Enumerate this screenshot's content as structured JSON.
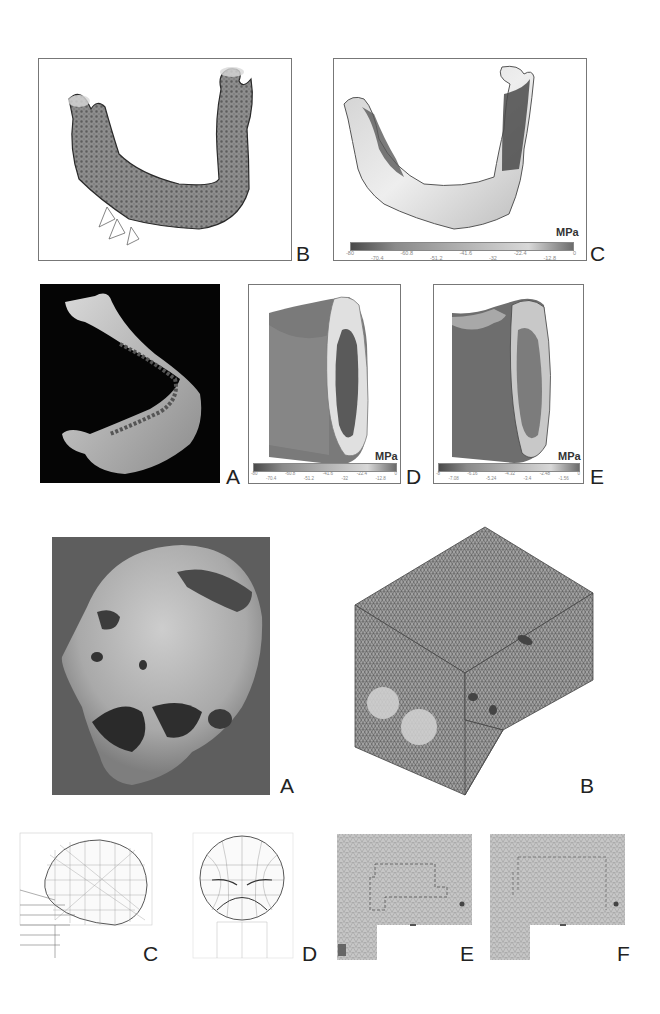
{
  "figure_top": {
    "panels": {
      "B": {
        "label": "B",
        "description": "Finite element mesh of mandible with load vectors"
      },
      "C": {
        "label": "C",
        "unit": "MPa",
        "colorbar_ticks": [
          "-80",
          "-70.4",
          "-60.8",
          "-51.2",
          "-41.6",
          "-32",
          "-22.4",
          "-12.8",
          "0"
        ]
      },
      "A": {
        "label": "A",
        "description": "3D reconstruction of mandible on black background"
      },
      "D": {
        "label": "D",
        "unit": "MPa",
        "colorbar_ticks": [
          "-80",
          "-70.4",
          "-60.8",
          "-51.2",
          "-41.6",
          "-32",
          "-22.4",
          "-12.8",
          "0"
        ]
      },
      "E": {
        "label": "E",
        "unit": "MPa",
        "colorbar_ticks": [
          "-8",
          "-7.08",
          "-6.16",
          "-5.24",
          "-4.32",
          "-3.4",
          "-2.48",
          "-1.56",
          "0"
        ]
      }
    }
  },
  "figure_bottom": {
    "panels": {
      "A": {
        "label": "A",
        "description": "Photograph of trepanned skull"
      },
      "B": {
        "label": "B",
        "description": "Tetrahedral mesh block model with cranial cavities"
      },
      "C": {
        "label": "C",
        "description": "Lateral wireframe view of skull model"
      },
      "D": {
        "label": "D",
        "description": "Frontal wireframe view of skull model"
      },
      "E": {
        "label": "E",
        "description": "Mesh cross-section"
      },
      "F": {
        "label": "F",
        "description": "Mesh cross-section"
      }
    }
  }
}
